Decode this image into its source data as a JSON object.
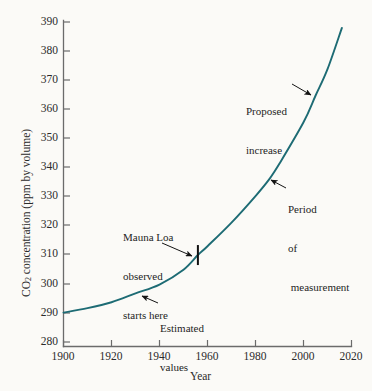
{
  "figure": {
    "background_color": "#fbfaf7",
    "axis_color": "#6b6b6b",
    "curve_color": "#1d6b74",
    "text_color": "#2b2b2b",
    "marker_color": "#111111"
  },
  "chart_data": {
    "type": "line",
    "title": "",
    "xlabel": "Year",
    "ylabel": "CO2 concentration (ppm by volume)",
    "ylabel_parts": {
      "prefix": "CO",
      "subscript": "2",
      "suffix": " concentration (ppm by volume)"
    },
    "xlim": [
      1900,
      2020
    ],
    "ylim": [
      280,
      390
    ],
    "grid": false,
    "legend": null,
    "xticks": [
      1900,
      1920,
      1940,
      1960,
      1980,
      2000,
      2020
    ],
    "xticklabels": [
      "1900",
      "1920",
      "1940",
      "1960",
      "1980",
      "2000",
      "2020"
    ],
    "yticks": [
      280,
      290,
      300,
      310,
      320,
      330,
      340,
      350,
      360,
      370,
      380,
      390
    ],
    "yticklabels": [
      "280",
      "290",
      "300",
      "310",
      "320",
      "330",
      "340",
      "350",
      "360",
      "370",
      "380",
      "390"
    ],
    "series": [
      {
        "name": "CO2 concentration",
        "color": "#1d6b74",
        "x": [
          1900,
          1910,
          1920,
          1930,
          1940,
          1950,
          1956,
          1960,
          1970,
          1980,
          1986,
          1990,
          2000,
          2005,
          2010,
          2016
        ],
        "y": [
          291.5,
          293.0,
          295.0,
          298.0,
          301.0,
          306.0,
          311.0,
          314.0,
          322.0,
          331.0,
          337.0,
          342.0,
          356.0,
          365.0,
          374.0,
          388.0
        ]
      }
    ],
    "markers": [
      {
        "name": "mauna-loa-start-tick",
        "x": 1956,
        "y": 311,
        "style": "vertical-tick"
      }
    ],
    "annotations": [
      {
        "id": "mauna-loa",
        "lines": [
          "Mauna Loa",
          "observed",
          "starts here"
        ],
        "points_to": {
          "x": 1956,
          "y": 311
        }
      },
      {
        "id": "estimated-values",
        "lines": [
          "Estimated",
          "values"
        ],
        "points_to": {
          "x": 1931,
          "y": 298.5
        }
      },
      {
        "id": "period-of-measurement",
        "lines": [
          "Period",
          "of",
          " measurement"
        ],
        "points_to": {
          "x": 1986,
          "y": 337
        }
      },
      {
        "id": "proposed-increase",
        "lines": [
          "Proposed",
          "increase"
        ],
        "points_to": {
          "x": 2005,
          "y": 365
        }
      }
    ]
  }
}
